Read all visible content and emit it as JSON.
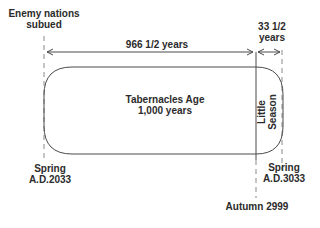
{
  "diagram": {
    "top_left_label": [
      "Enemy nations",
      "subued"
    ],
    "main_span_label": "966 1/2 years",
    "small_span_label": [
      "33 1/2",
      "years"
    ],
    "main_box": {
      "title": "Tabernacles Age",
      "subtitle": "1,000 years"
    },
    "end_segment_label": [
      "Little",
      "Season"
    ],
    "bottom_left_label": [
      "Spring",
      "A.D.2033"
    ],
    "bottom_right_label": [
      "Spring",
      "A.D.3033"
    ],
    "bottom_center_label": "Autumn 2999",
    "colors": {
      "line": "#4a4a4a",
      "text": "#2b2b2b",
      "dashed": "#8a8a8a",
      "background": "#ffffff"
    }
  }
}
